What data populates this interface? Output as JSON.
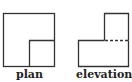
{
  "figures": [
    {
      "name": "plan",
      "label": "plan",
      "shapes": {
        "outer_square": {
          "x": 3,
          "y": 13,
          "width": 51,
          "height": 53
        },
        "inner_square": {
          "x": 29,
          "y": 40,
          "width": 25,
          "height": 26
        }
      }
    },
    {
      "name": "elevation-x",
      "label": "elevation X",
      "shapes": {
        "upper_block": {
          "x": 104,
          "y": 13,
          "width": 24,
          "height": 27
        },
        "lower_block": {
          "x": 78,
          "y": 40,
          "width": 50,
          "height": 26
        },
        "hidden_edge": {
          "x1": 104,
          "y1": 40,
          "x2": 128,
          "y2": 40,
          "style": "dashed"
        }
      }
    }
  ],
  "colors": {
    "stroke": "#333333",
    "background": "#ffffff"
  }
}
